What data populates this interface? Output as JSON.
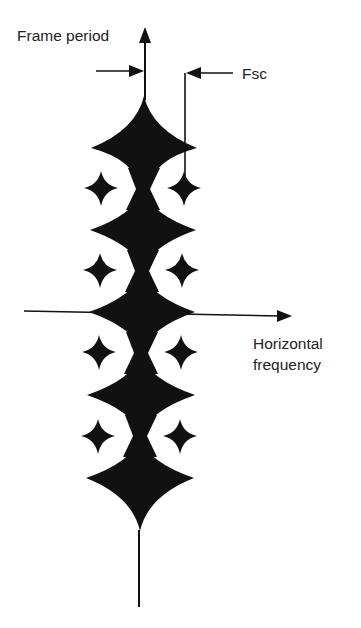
{
  "labels": {
    "vertical_axis": "Frame period",
    "fsc": "Fsc",
    "horizontal_axis_line1": "Horizontal",
    "horizontal_axis_line2": "frequency"
  },
  "colors": {
    "ink": "#111111",
    "text": "#222222",
    "background": "#ffffff"
  },
  "diagram": {
    "main_stars": [
      {
        "cx": 144,
        "cy": 148,
        "half_w": 53,
        "up": 52,
        "down": 40
      },
      {
        "cx": 143,
        "cy": 230,
        "half_w": 53,
        "up": 40,
        "down": 40
      },
      {
        "cx": 142,
        "cy": 312,
        "half_w": 53,
        "up": 40,
        "down": 40
      },
      {
        "cx": 141,
        "cy": 395,
        "half_w": 54,
        "up": 40,
        "down": 40
      },
      {
        "cx": 140,
        "cy": 478,
        "half_w": 54,
        "up": 40,
        "down": 52
      }
    ],
    "side_stars": [
      {
        "cx": 101,
        "cy": 188
      },
      {
        "cx": 184,
        "cy": 188
      },
      {
        "cx": 100,
        "cy": 270
      },
      {
        "cx": 182,
        "cy": 270
      },
      {
        "cx": 99,
        "cy": 352
      },
      {
        "cx": 181,
        "cy": 352
      },
      {
        "cx": 98,
        "cy": 436
      },
      {
        "cx": 180,
        "cy": 436
      }
    ]
  }
}
